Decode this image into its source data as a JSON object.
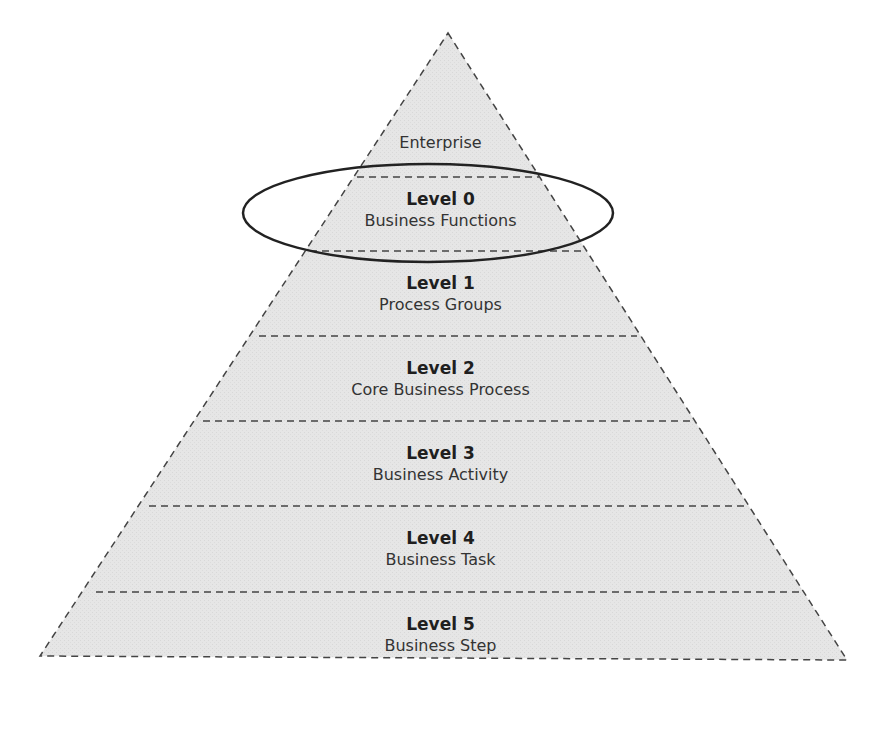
{
  "diagram": {
    "type": "pyramid",
    "colors": {
      "fill": "#e4e4e4",
      "dash_stroke": "#444444",
      "ellipse_stroke": "#222222",
      "text": "#2a2a2a"
    },
    "apex": {
      "label": "Enterprise"
    },
    "levels": [
      {
        "title": "Level 0",
        "name": "Business Functions",
        "highlighted": true
      },
      {
        "title": "Level 1",
        "name": "Process Groups"
      },
      {
        "title": "Level 2",
        "name": "Core Business Process"
      },
      {
        "title": "Level 3",
        "name": "Business Activity"
      },
      {
        "title": "Level 4",
        "name": "Business Task"
      },
      {
        "title": "Level 5",
        "name": "Business Step"
      }
    ],
    "highlight": {
      "shape": "ellipse",
      "target": "Level 0"
    }
  }
}
